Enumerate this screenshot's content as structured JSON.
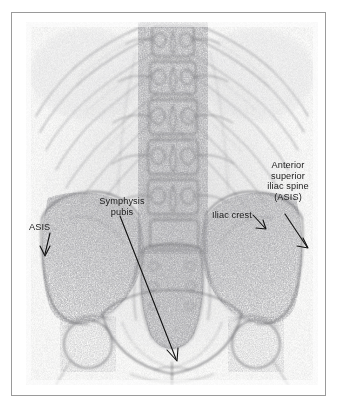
{
  "figure": {
    "type": "radiograph",
    "view": "anteroposterior",
    "region": "lumbar spine and pelvis",
    "modality": "plain film X-ray",
    "frame_color": "#9a9a9a",
    "page_background": "#ffffff",
    "plate_background": "#fbfbfa",
    "ink_color": "#1b1b1b"
  },
  "annotations": [
    {
      "id": "asis-left",
      "label": "ASIS",
      "lines": [
        "ASIS"
      ],
      "target": "left anterior superior iliac spine",
      "arrow_direction": "down-left"
    },
    {
      "id": "symphysis-pubis",
      "label": "Symphysis pubis",
      "lines": [
        "Symphysis",
        "pubis"
      ],
      "target": "pubic symphysis",
      "arrow_direction": "down-right"
    },
    {
      "id": "iliac-crest",
      "label": "Iliac crest",
      "lines": [
        "Iliac crest"
      ],
      "target": "right iliac crest",
      "arrow_direction": "down-right"
    },
    {
      "id": "asis-right",
      "label": "Anterior superior iliac spine (ASIS)",
      "lines": [
        "Anterior",
        "superior",
        "iliac spine",
        "(ASIS)"
      ],
      "target": "right anterior superior iliac spine",
      "arrow_direction": "down-right"
    }
  ],
  "anatomy_visible": [
    "lower rib cage",
    "lumbar vertebrae L1-L5",
    "transverse processes",
    "sacrum",
    "iliac crests",
    "iliac wings",
    "femoral heads",
    "pubic symphysis"
  ]
}
